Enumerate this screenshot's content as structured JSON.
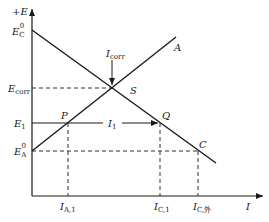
{
  "diagram": {
    "type": "evans-polarization-diagram",
    "axes": {
      "y_label": "+E",
      "x_label": "I"
    },
    "potentials": {
      "ec0": {
        "main": "E",
        "sub": "C",
        "sup": "0"
      },
      "ecorr": {
        "main": "E",
        "sub": "corr"
      },
      "e1": {
        "main": "E",
        "sub": "1"
      },
      "ea0": {
        "main": "E",
        "sub": "A",
        "sup": "0"
      }
    },
    "points": {
      "s": "S",
      "p": "P",
      "q": "Q",
      "c": "C",
      "a": "A"
    },
    "currents": {
      "icorr": {
        "main": "I",
        "sub": "corr"
      },
      "i1": {
        "main": "I",
        "sub": "1"
      },
      "ia1": {
        "main": "I",
        "sub": "A,1"
      },
      "ic1": {
        "main": "I",
        "sub": "C,1"
      },
      "icext": {
        "main": "I",
        "sub": "C,外"
      }
    },
    "colors": {
      "line": "#1a1a1a",
      "background": "#ffffff"
    }
  }
}
